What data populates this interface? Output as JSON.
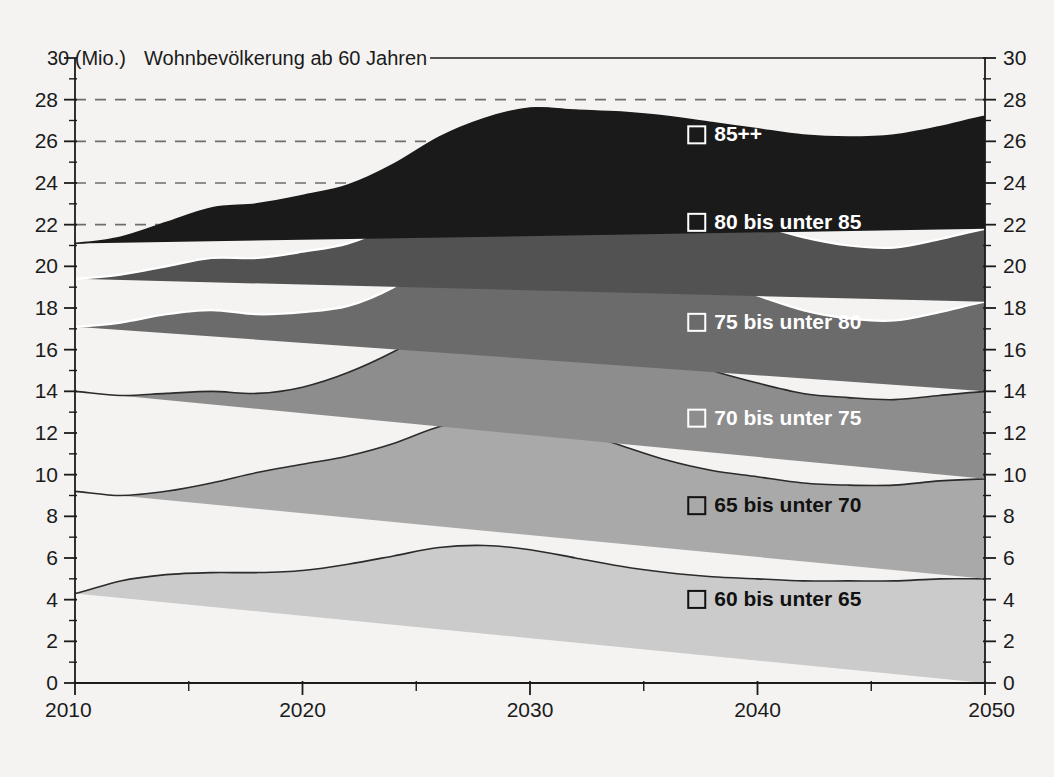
{
  "chart_data": {
    "type": "area",
    "stacked": true,
    "title": "30 (Mio.)  Wohnbevölkerung ab 60 Jahren",
    "title_prefix": "30 (Mio.)",
    "title_text": "Wohnbevölkerung ab 60 Jahren",
    "unit": "Mio.",
    "xlabel": "",
    "ylabel": "",
    "xlim": [
      2010,
      2050
    ],
    "ylim": [
      0,
      30
    ],
    "y_tick_step": 2,
    "y_minor_tick_step": 1,
    "x_tick_step": 10,
    "x_minor_tick_step": 5,
    "grid": "dashed-horizontal-upper-only",
    "gridlines_at": [
      22,
      24,
      26,
      28
    ],
    "legend_position": "inside-right",
    "y_ticks": [
      0,
      2,
      4,
      6,
      8,
      10,
      12,
      14,
      16,
      18,
      20,
      22,
      24,
      26,
      28,
      30
    ],
    "y_tick_labels": [
      "0",
      "2",
      "4",
      "6",
      "8",
      "10",
      "12",
      "14",
      "16",
      "18",
      "20",
      "22",
      "24",
      "26",
      "28",
      "30"
    ],
    "right_axis_ticks": [
      0,
      2,
      4,
      6,
      8,
      10,
      12,
      14,
      16,
      18,
      20,
      22,
      24,
      26,
      28,
      30
    ],
    "right_axis_tick_labels": [
      "0",
      "2",
      "4",
      "6",
      "8",
      "10",
      "12",
      "14",
      "16",
      "18",
      "20",
      "22",
      "24",
      "26",
      "28",
      "30"
    ],
    "x_ticks": [
      2010,
      2020,
      2030,
      2040,
      2050
    ],
    "x_tick_labels": [
      "2010",
      "2020",
      "2030",
      "2040",
      "2050"
    ],
    "x_minor_ticks": [
      2015,
      2025,
      2035,
      2045
    ],
    "x": [
      2010,
      2012,
      2014,
      2016,
      2018,
      2020,
      2022,
      2024,
      2026,
      2028,
      2030,
      2032,
      2034,
      2036,
      2038,
      2040,
      2042,
      2044,
      2046,
      2048,
      2050
    ],
    "series": [
      {
        "name": "60 bis unter 65",
        "color": "#cbcbcb",
        "line_color": "#2b2b2b",
        "label_color": "#111111",
        "values": [
          4.3,
          4.9,
          5.2,
          5.3,
          5.3,
          5.4,
          5.7,
          6.1,
          6.5,
          6.6,
          6.4,
          6.0,
          5.6,
          5.3,
          5.1,
          5.0,
          4.9,
          4.9,
          4.9,
          5.0,
          5.0
        ]
      },
      {
        "name": "65 bis unter 70",
        "color": "#a9a9a9",
        "line_color": "#2b2b2b",
        "label_color": "#111111",
        "values": [
          4.9,
          4.1,
          4.0,
          4.3,
          4.8,
          5.1,
          5.2,
          5.4,
          5.8,
          6.1,
          6.2,
          6.1,
          5.8,
          5.4,
          5.1,
          4.9,
          4.7,
          4.6,
          4.6,
          4.7,
          4.8
        ]
      },
      {
        "name": "70 bis unter 75",
        "color": "#8d8d8d",
        "line_color": "#2b2b2b",
        "label_color": "#ffffff",
        "values": [
          4.8,
          4.8,
          4.7,
          4.4,
          3.8,
          3.7,
          4.0,
          4.4,
          4.8,
          5.0,
          5.1,
          5.2,
          5.2,
          5.1,
          4.8,
          4.5,
          4.3,
          4.2,
          4.1,
          4.1,
          4.2
        ]
      },
      {
        "name": "75 bis unter 80",
        "color": "#6b6b6b",
        "line_color": "#ffffff",
        "label_color": "#ffffff",
        "values": [
          3.1,
          3.5,
          3.8,
          3.9,
          3.8,
          3.6,
          3.2,
          3.1,
          3.3,
          3.6,
          3.9,
          4.1,
          4.2,
          4.3,
          4.3,
          4.2,
          4.0,
          3.8,
          3.8,
          4.0,
          4.3
        ]
      },
      {
        "name": "80 bis unter 85",
        "color": "#525252",
        "line_color": "#ffffff",
        "label_color": "#ffffff",
        "values": [
          2.3,
          2.3,
          2.3,
          2.5,
          2.7,
          2.9,
          3.0,
          3.0,
          2.8,
          2.6,
          2.5,
          2.7,
          2.9,
          3.1,
          3.3,
          3.4,
          3.5,
          3.5,
          3.5,
          3.5,
          3.5
        ]
      },
      {
        "name": "85++",
        "color": "#1a1a1a",
        "line_color": "#1a1a1a",
        "label_color": "#ffffff",
        "values": [
          1.7,
          1.8,
          2.1,
          2.4,
          2.6,
          2.7,
          2.8,
          2.9,
          3.0,
          3.2,
          3.5,
          3.4,
          3.7,
          4.0,
          4.3,
          4.6,
          4.9,
          5.2,
          5.4,
          5.4,
          5.4
        ]
      }
    ],
    "cumulative_totals": [
      21.1,
      21.4,
      22.1,
      22.8,
      23.0,
      23.4,
      23.9,
      24.9,
      26.2,
      27.1,
      27.6,
      28.5,
      28.4,
      28.3,
      28.3,
      28.3,
      28.3,
      28.2,
      28.3,
      28.4,
      28.3
    ],
    "legend_entries": [
      {
        "label": "85++",
        "x_value": 2037,
        "y_value": 26.0,
        "text_color": "#ffffff",
        "marker": "outline-square"
      },
      {
        "label": "80 bis unter 85",
        "x_value": 2037,
        "y_value": 21.8,
        "text_color": "#ffffff",
        "marker": "outline-square"
      },
      {
        "label": "75 bis unter 80",
        "x_value": 2037,
        "y_value": 17.0,
        "text_color": "#ffffff",
        "marker": "outline-square"
      },
      {
        "label": "70 bis unter 75",
        "x_value": 2037,
        "y_value": 12.4,
        "text_color": "#ffffff",
        "marker": "outline-square"
      },
      {
        "label": "65 bis unter 70",
        "x_value": 2037,
        "y_value": 8.2,
        "text_color": "#111111",
        "marker": "outline-square"
      },
      {
        "label": "60 bis unter 65",
        "x_value": 2037,
        "y_value": 3.7,
        "text_color": "#111111",
        "marker": "outline-square"
      }
    ]
  }
}
